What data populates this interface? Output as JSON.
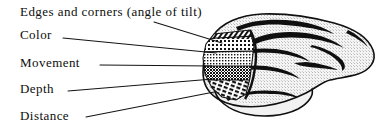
{
  "figure": {
    "type": "anatomical-diagram",
    "background_color": "#ffffff",
    "ink_color": "#0d0d0d",
    "labels": [
      {
        "id": "edges-and-corners",
        "text": "Edges and corners (angle of tilt)",
        "x": 20,
        "y": 8,
        "leader": {
          "x1": 154,
          "y1": 22,
          "x2": 222,
          "y2": 43
        }
      },
      {
        "id": "color",
        "text": "Color",
        "x": 20,
        "y": 31,
        "leader": {
          "x1": 63,
          "y1": 38,
          "x2": 216,
          "y2": 53
        }
      },
      {
        "id": "movement",
        "text": "Movement",
        "x": 20,
        "y": 59,
        "leader": {
          "x1": 100,
          "y1": 65,
          "x2": 212,
          "y2": 66
        }
      },
      {
        "id": "depth",
        "text": "Depth",
        "x": 20,
        "y": 85,
        "leader": {
          "x1": 68,
          "y1": 91,
          "x2": 213,
          "y2": 79
        }
      },
      {
        "id": "distance",
        "text": "Distance",
        "x": 20,
        "y": 112,
        "leader": {
          "x1": 86,
          "y1": 117,
          "x2": 214,
          "y2": 92
        }
      }
    ],
    "bands": [
      {
        "id": "band-edges",
        "pattern": "diagonal-hatch",
        "label_ref": "edges-and-corners"
      },
      {
        "id": "band-color",
        "pattern": "coarse-stipple",
        "label_ref": "color"
      },
      {
        "id": "band-movement",
        "pattern": "fine-stipple",
        "label_ref": "movement"
      },
      {
        "id": "band-depth",
        "pattern": "dense-stipple",
        "label_ref": "depth"
      },
      {
        "id": "band-distance",
        "pattern": "dash-hatch",
        "label_ref": "distance"
      }
    ]
  }
}
